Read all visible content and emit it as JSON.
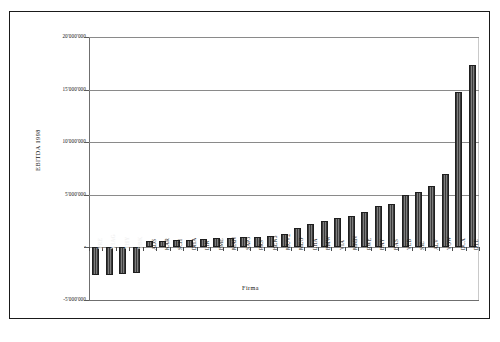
{
  "figure": {
    "cropped_header_text": "",
    "frame": true
  },
  "chart_data": {
    "type": "bar",
    "title": "",
    "xlabel": "Firma",
    "ylabel": "EBITDA 1998",
    "ylim": [
      -5000000,
      20000000
    ],
    "grid": true,
    "legend": "none",
    "ytick_labels": [
      "20'000'000",
      "15'000'000",
      "10'000'000",
      "5'000'000",
      "-",
      "-5'000'000"
    ],
    "ytick_values": [
      20000000,
      15000000,
      10000000,
      5000000,
      0,
      -5000000
    ],
    "categories": [
      "PRE",
      "VIAG",
      "THY",
      "DBK",
      "ADS",
      "KAR",
      "SCH",
      "DHA",
      "LIN",
      "FME",
      "MAN",
      "SAP3",
      "PRS",
      "HEN3",
      "MUV2",
      "MEO",
      "LHA",
      "BMW",
      "VIA",
      "MMN",
      "RWE",
      "BAY",
      "BAS",
      "VEB",
      "SIE",
      "ALV",
      "VOW",
      "DCX",
      "DTE"
    ],
    "values": [
      -2600000,
      -2600000,
      -2500000,
      -2400000,
      600000,
      600000,
      700000,
      750000,
      800000,
      850000,
      900000,
      950000,
      1000000,
      1100000,
      1300000,
      1800000,
      2200000,
      2500000,
      2800000,
      3000000,
      3400000,
      3900000,
      4100000,
      5000000,
      5300000,
      5800000,
      7000000,
      14800000,
      17300000
    ]
  },
  "axis_title_x": "Firma",
  "axis_title_y": "EBITDA 1998"
}
